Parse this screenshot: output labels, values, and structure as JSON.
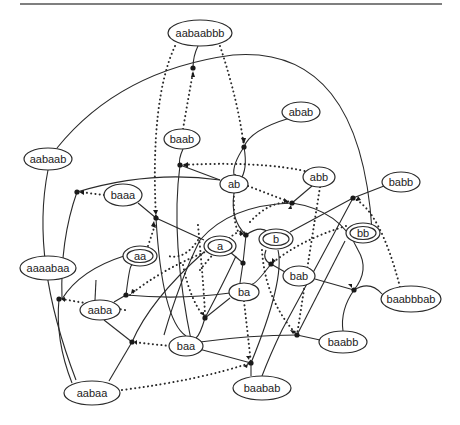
{
  "diagram": {
    "type": "hypergraph / automaton diagram",
    "nodes": [
      {
        "id": "aabaabbb",
        "label": "aabaabbb",
        "x": 200,
        "y": 33,
        "rx": 32,
        "ry": 13,
        "double": false
      },
      {
        "id": "abab",
        "label": "abab",
        "x": 301,
        "y": 112,
        "rx": 19,
        "ry": 10,
        "double": false
      },
      {
        "id": "baab",
        "label": "baab",
        "x": 182,
        "y": 139,
        "rx": 18,
        "ry": 10,
        "double": false
      },
      {
        "id": "aabaab",
        "label": "aabaab",
        "x": 48,
        "y": 159,
        "rx": 24,
        "ry": 11,
        "double": false
      },
      {
        "id": "ab",
        "label": "ab",
        "x": 234,
        "y": 184,
        "rx": 14,
        "ry": 9,
        "double": false
      },
      {
        "id": "abb",
        "label": "abb",
        "x": 319,
        "y": 177,
        "rx": 16,
        "ry": 10,
        "double": false
      },
      {
        "id": "babb",
        "label": "babb",
        "x": 401,
        "y": 182,
        "rx": 19,
        "ry": 10,
        "double": false
      },
      {
        "id": "baaa",
        "label": "baaa",
        "x": 123,
        "y": 195,
        "rx": 19,
        "ry": 11,
        "double": false
      },
      {
        "id": "a",
        "label": "a",
        "x": 220,
        "y": 246,
        "rx": 16,
        "ry": 10,
        "double": true
      },
      {
        "id": "b",
        "label": "b",
        "x": 276,
        "y": 239,
        "rx": 17,
        "ry": 10,
        "double": true
      },
      {
        "id": "bb",
        "label": "bb",
        "x": 363,
        "y": 233,
        "rx": 17,
        "ry": 10,
        "double": true
      },
      {
        "id": "aa",
        "label": "aa",
        "x": 140,
        "y": 256,
        "rx": 17,
        "ry": 10,
        "double": true
      },
      {
        "id": "aaaabaa",
        "label": "aaaabaa",
        "x": 48,
        "y": 268,
        "rx": 28,
        "ry": 12,
        "double": false
      },
      {
        "id": "bab",
        "label": "bab",
        "x": 299,
        "y": 276,
        "rx": 16,
        "ry": 10,
        "double": false
      },
      {
        "id": "ba",
        "label": "ba",
        "x": 244,
        "y": 292,
        "rx": 15,
        "ry": 9,
        "double": false
      },
      {
        "id": "baabbbab",
        "label": "baabbbab",
        "x": 411,
        "y": 299,
        "rx": 30,
        "ry": 13,
        "double": false
      },
      {
        "id": "aaba",
        "label": "aaba",
        "x": 100,
        "y": 310,
        "rx": 20,
        "ry": 10,
        "double": false
      },
      {
        "id": "baa",
        "label": "baa",
        "x": 186,
        "y": 346,
        "rx": 17,
        "ry": 10,
        "double": false
      },
      {
        "id": "baabb",
        "label": "baabb",
        "x": 343,
        "y": 342,
        "rx": 24,
        "ry": 11,
        "double": false
      },
      {
        "id": "aabaa",
        "label": "aabaa",
        "x": 92,
        "y": 393,
        "rx": 28,
        "ry": 12,
        "double": false
      },
      {
        "id": "baabab",
        "label": "baabab",
        "x": 262,
        "y": 388,
        "rx": 29,
        "ry": 12,
        "double": false
      }
    ],
    "junctions": [
      {
        "id": "j1",
        "x": 193,
        "y": 68
      },
      {
        "id": "j2",
        "x": 244,
        "y": 147
      },
      {
        "id": "j3",
        "x": 180,
        "y": 165
      },
      {
        "id": "j4",
        "x": 77,
        "y": 192
      },
      {
        "id": "j5",
        "x": 156,
        "y": 218
      },
      {
        "id": "j6",
        "x": 292,
        "y": 203
      },
      {
        "id": "j7",
        "x": 246,
        "y": 235
      },
      {
        "id": "j8",
        "x": 353,
        "y": 198
      },
      {
        "id": "j9",
        "x": 271,
        "y": 264
      },
      {
        "id": "j10",
        "x": 243,
        "y": 263
      },
      {
        "id": "j11",
        "x": 126,
        "y": 295
      },
      {
        "id": "j12",
        "x": 59,
        "y": 299
      },
      {
        "id": "j13",
        "x": 132,
        "y": 342
      },
      {
        "id": "j14",
        "x": 297,
        "y": 335
      },
      {
        "id": "j15",
        "x": 251,
        "y": 363
      },
      {
        "id": "j16",
        "x": 205,
        "y": 318
      },
      {
        "id": "j17",
        "x": 354,
        "y": 290
      }
    ]
  }
}
